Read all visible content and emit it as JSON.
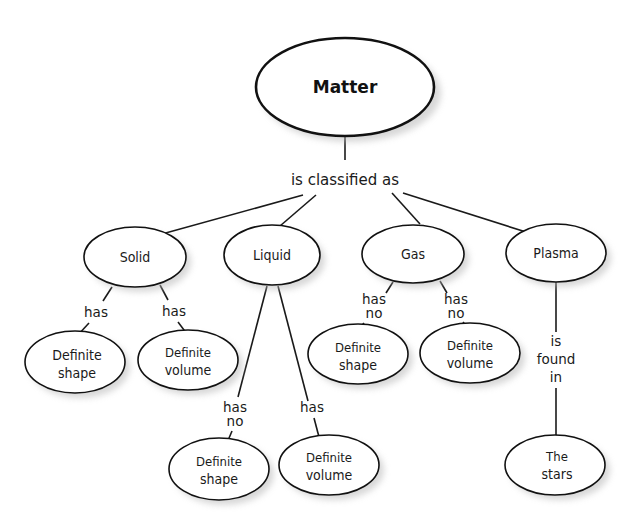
{
  "root": {
    "label": "Matter"
  },
  "root_link": {
    "label": "is classified as"
  },
  "states": [
    {
      "label": "Solid"
    },
    {
      "label": "Liquid"
    },
    {
      "label": "Gas"
    },
    {
      "label": "Plasma"
    }
  ],
  "solid": {
    "links": [
      {
        "line1": "has"
      },
      {
        "line1": "has"
      }
    ],
    "children": [
      {
        "line1": "Definite",
        "line2": "shape"
      },
      {
        "line1": "Definite",
        "line2": "volume"
      }
    ]
  },
  "liquid": {
    "links": [
      {
        "line1": "has",
        "line2": "no"
      },
      {
        "line1": "has"
      }
    ],
    "children": [
      {
        "line1": "Definite",
        "line2": "shape"
      },
      {
        "line1": "Definite",
        "line2": "volume"
      }
    ]
  },
  "gas": {
    "links": [
      {
        "line1": "has",
        "line2": "no"
      },
      {
        "line1": "has",
        "line2": "no"
      }
    ],
    "children": [
      {
        "line1": "Definite",
        "line2": "shape"
      },
      {
        "line1": "Definite",
        "line2": "volume"
      }
    ]
  },
  "plasma": {
    "link": {
      "line1": "is",
      "line2": "found",
      "line3": "in"
    },
    "child": {
      "line1": "The",
      "line2": "stars"
    }
  }
}
